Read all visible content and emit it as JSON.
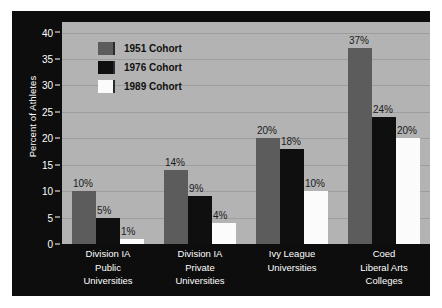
{
  "chart_data": {
    "type": "bar",
    "title": "",
    "xlabel": "",
    "ylabel": "Percent of Athletes",
    "ylim": [
      0,
      42
    ],
    "yticks": [
      0,
      5,
      10,
      15,
      20,
      25,
      30,
      35,
      40
    ],
    "grid": true,
    "legend_position": "upper-left-inside",
    "categories": [
      "Division IA Public Universities",
      "Division IA Private Universities",
      "Ivy League Universities",
      "Coed Liberal Arts Colleges"
    ],
    "category_lines": [
      [
        "Division IA",
        "Public",
        "Universities"
      ],
      [
        "Division IA",
        "Private",
        "Universities"
      ],
      [
        "Ivy League",
        "Universities"
      ],
      [
        "Coed",
        "Liberal Arts",
        "Colleges"
      ]
    ],
    "series": [
      {
        "name": "1951 Cohort",
        "color": "#5c5c5c",
        "values": [
          10,
          14,
          20,
          37
        ],
        "labels": [
          "10%",
          "14%",
          "20%",
          "37%"
        ]
      },
      {
        "name": "1976 Cohort",
        "color": "#100f10",
        "values": [
          5,
          9,
          18,
          24
        ],
        "labels": [
          "5%",
          "9%",
          "18%",
          "24%"
        ]
      },
      {
        "name": "1989 Cohort",
        "color": "#fbfbfb",
        "values": [
          1,
          4,
          10,
          20
        ],
        "labels": [
          "1%",
          "4%",
          "10%",
          "20%"
        ]
      }
    ]
  },
  "colors": {
    "figure_background": "#0d0d0d",
    "plot_background": "#b3b3b3",
    "gridline": "#9d9d9d",
    "axis_text": "#ffffff",
    "value_label_text": "#1a1a1a",
    "legend_text": "#111111"
  },
  "yticklabels": [
    "0",
    "5",
    "10",
    "15",
    "20",
    "25",
    "30",
    "35",
    "40"
  ]
}
